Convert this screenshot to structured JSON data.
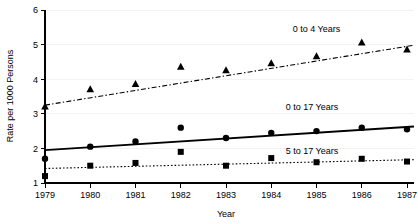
{
  "chart_data": {
    "type": "scatter",
    "title": "",
    "xlabel": "Year",
    "ylabel": "Rate per 1000 Persons",
    "x": [
      1979,
      1980,
      1981,
      1982,
      1983,
      1984,
      1985,
      1986,
      1987
    ],
    "categories": [
      "1979",
      "1980",
      "1981",
      "1982",
      "1983",
      "1984",
      "1985",
      "1986",
      "1987"
    ],
    "xlim": [
      1979,
      1987
    ],
    "ylim": [
      1,
      6
    ],
    "yticks": [
      1,
      2,
      3,
      4,
      5,
      6
    ],
    "ytick_labels": [
      "1",
      "2",
      "3",
      "4",
      "5",
      "6"
    ],
    "xtick_labels": [
      "1979",
      "1980",
      "1981",
      "1982",
      "1983",
      "1984",
      "1985",
      "1986",
      "1987"
    ],
    "grid": false,
    "legend_position": "in-plot-annotations",
    "series": [
      {
        "name": "0 to 4 Years",
        "marker": "triangle",
        "line_style": "dash-dot",
        "values": [
          3.2,
          3.7,
          3.85,
          4.35,
          4.25,
          4.45,
          4.65,
          5.05,
          4.85
        ],
        "trend_start": 3.25,
        "trend_end": 4.95
      },
      {
        "name": "0 to 17 Years",
        "marker": "circle",
        "line_style": "solid",
        "values": [
          1.7,
          2.05,
          2.2,
          2.6,
          2.3,
          2.45,
          2.5,
          2.6,
          2.55
        ],
        "trend_start": 1.95,
        "trend_end": 2.62
      },
      {
        "name": "5 to 17 Years",
        "marker": "square",
        "line_style": "dotted",
        "values": [
          1.2,
          1.5,
          1.58,
          1.9,
          1.5,
          1.72,
          1.6,
          1.7,
          1.62
        ],
        "trend_start": 1.42,
        "trend_end": 1.67
      }
    ],
    "annotations": [
      {
        "text": "0 to 4 Years",
        "x": 1985.0,
        "y": 5.35
      },
      {
        "text": "0 to 17 Years",
        "x": 1984.9,
        "y": 3.12
      },
      {
        "text": "5 to 17 Years",
        "x": 1984.9,
        "y": 1.85
      }
    ]
  }
}
